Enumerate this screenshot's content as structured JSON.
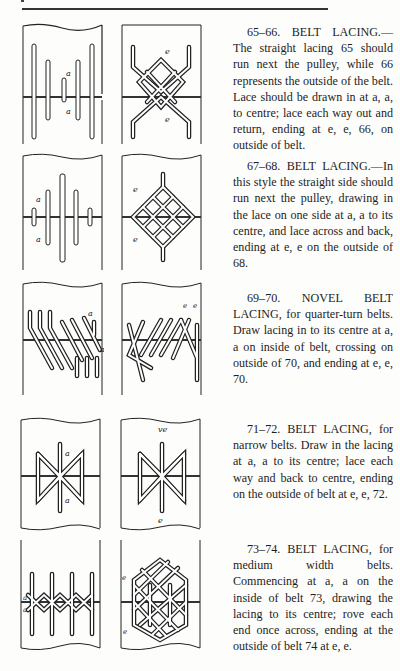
{
  "sections": [
    {
      "figures": [
        "65",
        "66"
      ],
      "heading": "65–66. BELT LACING.",
      "text": "65–66. BELT LACING.—The straight lacing 65 should run next the pulley, while 66 represents the outside of the belt. Lace should be drawn in at a, a, to centre; lace each way out and return, ending at e, e, 66, on outside of belt.",
      "left_labels": [
        "a",
        "a"
      ],
      "right_labels": [
        "e",
        "e"
      ]
    },
    {
      "figures": [
        "67",
        "68"
      ],
      "heading": "67–68. BELT LACING.",
      "text": "67–68. BELT LACING.—In this style the straight side should run next the pulley, drawing in the lace on one side at a, a to its centre, and lace across and back, ending at e, e on the outside of 68.",
      "left_labels": [
        "a",
        "a"
      ],
      "right_labels": [
        "e",
        "e"
      ]
    },
    {
      "figures": [
        "69",
        "70"
      ],
      "heading": "69–70. NOVEL BELT LACING,",
      "text": "69–70. NOVEL BELT LACING, for quarter-turn belts. Draw lacing in to its centre at a, a on inside of belt, crossing on outside of 70, and ending at e, e, 70.",
      "left_labels": [
        "a",
        "a"
      ],
      "right_labels": [
        "e",
        "e"
      ]
    },
    {
      "figures": [
        "71",
        "72"
      ],
      "heading": "71–72. BELT LACING,",
      "text": "71–72. BELT LACING, for narrow belts. Draw in the lacing at a, a to its centre; lace each way and back to centre, ending on the outside of belt at e, e, 72.",
      "left_labels": [
        "a",
        "a"
      ],
      "right_labels": [
        "e",
        "e"
      ]
    },
    {
      "figures": [
        "73",
        "74"
      ],
      "heading": "73–74. BELT LACING,",
      "text": "73–74. BELT LACING, for medium width belts. Commencing at a, a on the inside of belt 73, drawing the lacing to its centre; rove each end once across, ending at the outside of belt 74 at e, e.",
      "left_labels": [
        "a",
        "a"
      ],
      "right_labels": [
        "e",
        "e"
      ]
    }
  ],
  "colors": {
    "ink": "#1e1e1e",
    "paper": "#fdfdfb"
  }
}
